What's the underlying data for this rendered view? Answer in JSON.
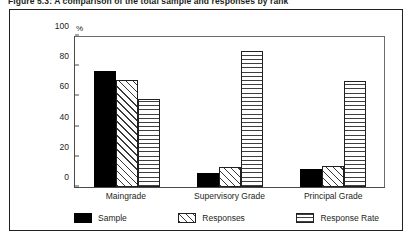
{
  "caption": "Figure 5.3:  A comparison of the total sample and responses by rank",
  "chart_data": {
    "type": "bar",
    "title": "Figure 5.3:  A comparison of the total sample and responses by rank",
    "xlabel": "",
    "ylabel": "%",
    "unit_label": "%",
    "categories": [
      "Maingrade",
      "Supervisory Grade",
      "Principal Grade"
    ],
    "series": [
      {
        "name": "Sample",
        "values": [
          77,
          9,
          12
        ],
        "pattern": "solid-black"
      },
      {
        "name": "Responses",
        "values": [
          71,
          13,
          14
        ],
        "pattern": "diagonal-hatch"
      },
      {
        "name": "Response Rate",
        "values": [
          58,
          90,
          70
        ],
        "pattern": "cross-hatch"
      }
    ],
    "ylim": [
      0,
      100
    ],
    "yticks": [
      0,
      20,
      40,
      60,
      80,
      100
    ],
    "grid": false,
    "legend_position": "bottom"
  },
  "colors": {
    "ink": "#231f20",
    "axis": "#4a4a4a",
    "sample": "#000000",
    "hatch": "#3a3a3a",
    "background": "#ffffff"
  }
}
